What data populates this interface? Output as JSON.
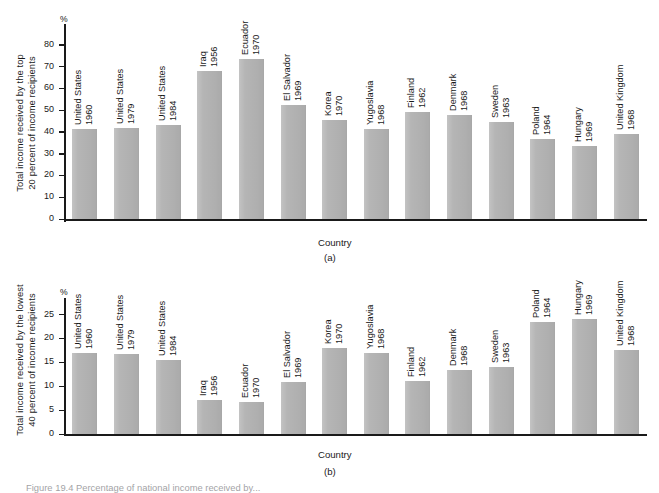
{
  "figure": {
    "caption": "Figure 19.4  Percentage of national income received by..."
  },
  "panels": [
    {
      "tag": "(a)",
      "ylabel_line1": "Total income received by the top",
      "ylabel_line2": "20 percent of income recipients",
      "unit_mark": "%",
      "xlabel": "Country",
      "ticks": [
        "0",
        "10",
        "20",
        "30",
        "40",
        "50",
        "60",
        "70",
        "80"
      ]
    },
    {
      "tag": "(b)",
      "ylabel_line1": "Total income received by the lowest",
      "ylabel_line2": "40 percent of income recipients",
      "unit_mark": "%",
      "xlabel": "Country",
      "ticks": [
        "0",
        "5",
        "10",
        "15",
        "20",
        "25"
      ]
    }
  ],
  "chart_data": [
    {
      "type": "bar",
      "title": "Total income received by the top 20 percent of income recipients",
      "panel": "(a)",
      "xlabel": "Country",
      "ylabel": "Total income received by the top 20 percent of income recipients",
      "yunit": "%",
      "ylim": [
        0,
        85
      ],
      "ytick_step": 10,
      "grid": false,
      "legend": "none",
      "categories": [
        "United States 1960",
        "United States 1979",
        "United States 1984",
        "Iraq 1956",
        "Ecuador 1970",
        "El Salvador 1969",
        "Korea 1970",
        "Yugoslavia 1968",
        "Finland 1962",
        "Denmark 1968",
        "Sweden 1963",
        "Poland 1964",
        "Hungary 1969",
        "United Kingdom 1968"
      ],
      "countries": [
        "United States",
        "United States",
        "United States",
        "Iraq",
        "Ecuador",
        "El Salvador",
        "Korea",
        "Yugoslavia",
        "Finland",
        "Denmark",
        "Sweden",
        "Poland",
        "Hungary",
        "United Kingdom"
      ],
      "years": [
        "1960",
        "1979",
        "1984",
        "1956",
        "1970",
        "1969",
        "1970",
        "1968",
        "1962",
        "1968",
        "1963",
        "1964",
        "1969",
        "1968"
      ],
      "values": [
        41.3,
        42.0,
        43.0,
        68.0,
        73.5,
        52.5,
        45.3,
        41.5,
        49.3,
        47.6,
        44.5,
        36.8,
        33.5,
        39.0
      ]
    },
    {
      "type": "bar",
      "title": "Total income received by the lowest 40 percent of income recipients",
      "panel": "(b)",
      "xlabel": "Country",
      "ylabel": "Total income received by the lowest 40 percent of income recipients",
      "yunit": "%",
      "ylim": [
        0,
        27
      ],
      "ytick_step": 5,
      "grid": false,
      "legend": "none",
      "categories": [
        "United States 1960",
        "United States 1979",
        "United States 1984",
        "Iraq 1956",
        "Ecuador 1970",
        "El Salvador 1969",
        "Korea 1970",
        "Yugoslavia 1968",
        "Finland 1962",
        "Denmark 1968",
        "Sweden 1963",
        "Poland 1964",
        "Hungary 1969",
        "United Kingdom 1968"
      ],
      "countries": [
        "United States",
        "United States",
        "United States",
        "Iraq",
        "Ecuador",
        "El Salvador",
        "Korea",
        "Yugoslavia",
        "Finland",
        "Denmark",
        "Sweden",
        "Poland",
        "Hungary",
        "United Kingdom"
      ],
      "years": [
        "1960",
        "1979",
        "1984",
        "1956",
        "1970",
        "1969",
        "1970",
        "1968",
        "1962",
        "1968",
        "1963",
        "1964",
        "1969",
        "1968"
      ],
      "values": [
        17.0,
        16.8,
        15.4,
        7.1,
        6.7,
        10.9,
        18.0,
        17.0,
        11.1,
        13.4,
        14.0,
        23.4,
        24.0,
        17.6
      ]
    }
  ]
}
